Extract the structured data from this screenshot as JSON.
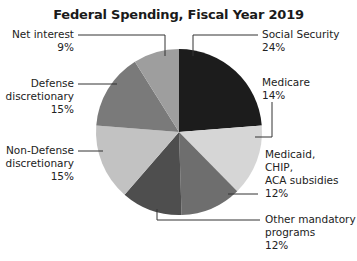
{
  "chart_data": {
    "type": "pie",
    "title": "Federal Spending, Fiscal Year 2019",
    "unit": "%",
    "start_angle_deg": 0,
    "direction": "clockwise",
    "slices": [
      {
        "label": "Social Security",
        "value": 24,
        "color": "#1c1c1c"
      },
      {
        "label": "Medicare",
        "value": 14,
        "color": "#d6d6d6"
      },
      {
        "label": "Medicaid, CHIP, ACA subsidies",
        "value": 12,
        "color": "#6e6e6e"
      },
      {
        "label": "Other mandatory programs",
        "value": 12,
        "color": "#4e4e4e"
      },
      {
        "label": "Non-Defense discretionary",
        "value": 15,
        "color": "#c2c2c2"
      },
      {
        "label": "Defense discretionary",
        "value": 15,
        "color": "#7a7a7a"
      },
      {
        "label": "Net interest",
        "value": 9,
        "color": "#9e9e9e"
      }
    ],
    "legend": "none (leader-line labels)"
  },
  "title": "Federal Spending, Fiscal Year 2019",
  "labels": {
    "social_security": {
      "lines": [
        "Social Security"
      ],
      "pct": "24%"
    },
    "medicare": {
      "lines": [
        "Medicare"
      ],
      "pct": "14%"
    },
    "medicaid": {
      "lines": [
        "Medicaid,",
        "CHIP,",
        "ACA subsidies"
      ],
      "pct": "12%"
    },
    "other_mandatory": {
      "lines": [
        "Other mandatory",
        "programs"
      ],
      "pct": "12%"
    },
    "non_defense": {
      "lines": [
        "Non-Defense",
        "discretionary"
      ],
      "pct": "15%"
    },
    "defense": {
      "lines": [
        "Defense",
        "discretionary"
      ],
      "pct": "15%"
    },
    "net_interest": {
      "lines": [
        "Net interest"
      ],
      "pct": "9%"
    }
  },
  "colors": {
    "leader_line": "#333333",
    "text": "#222222"
  }
}
